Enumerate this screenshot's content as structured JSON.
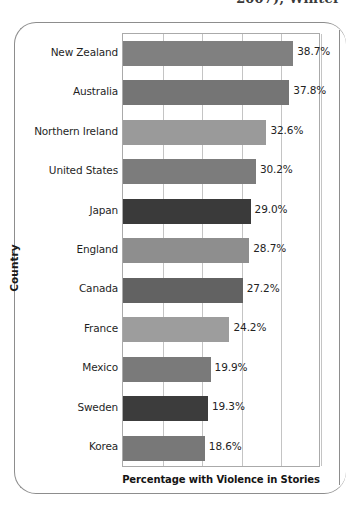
{
  "page": {
    "top_cut_text": "2007), Winter",
    "border_color": "#8d8d8d"
  },
  "chart_data": {
    "type": "bar",
    "orientation": "horizontal",
    "title": "",
    "xlabel": "Percentage with Violence in Stories",
    "ylabel": "Country",
    "categories": [
      "New Zealand",
      "Australia",
      "Northern Ireland",
      "United States",
      "Japan",
      "England",
      "Canada",
      "France",
      "Mexico",
      "Sweden",
      "Korea"
    ],
    "values": [
      38.7,
      37.8,
      32.6,
      30.2,
      29.0,
      28.7,
      27.2,
      24.2,
      19.9,
      19.3,
      18.6
    ],
    "data_labels": [
      "38.7%",
      "37.8%",
      "32.6%",
      "30.2%",
      "29.0%",
      "28.7%",
      "27.2%",
      "24.2%",
      "19.9%",
      "19.3%",
      "18.6%"
    ],
    "bar_colors": [
      "#808080",
      "#757575",
      "#9a9a9a",
      "#7c7c7c",
      "#3a3a3a",
      "#8e8e8e",
      "#626262",
      "#9d9d9d",
      "#7a7a7a",
      "#3c3c3c",
      "#787878"
    ],
    "xlim": [
      0,
      45
    ],
    "xticks": [
      0,
      9,
      18,
      27,
      36,
      45
    ],
    "grid": true,
    "grid_axis": "x",
    "legend": "none",
    "tick_labels_visible": false,
    "plot_border_color": "#aaaaaa",
    "gridline_color": "#c4c4c4"
  }
}
